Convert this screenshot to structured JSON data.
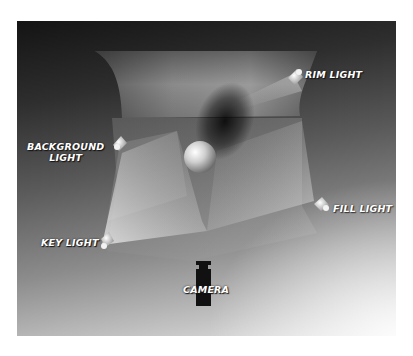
{
  "diagram": {
    "labels": {
      "rim_light": "RIM LIGHT",
      "background_light_line1": "BACKGROUND",
      "background_light_line2": "LIGHT",
      "fill_light": "FILL LIGHT",
      "key_light": "KEY LIGHT",
      "camera": "CAMERA"
    },
    "elements": [
      {
        "name": "backdrop",
        "type": "curved-backdrop"
      },
      {
        "name": "rim-light",
        "type": "light",
        "position": "top-right"
      },
      {
        "name": "background-light",
        "type": "light",
        "position": "left"
      },
      {
        "name": "fill-light",
        "type": "light",
        "position": "right"
      },
      {
        "name": "key-light",
        "type": "light",
        "position": "bottom-left"
      },
      {
        "name": "subject",
        "type": "sphere",
        "position": "center"
      },
      {
        "name": "camera",
        "type": "camera",
        "position": "bottom-center"
      }
    ],
    "colors": {
      "background_dark": "#141414",
      "background_light": "#e8e8e8",
      "label": "#ffffff",
      "camera": "#111111"
    }
  }
}
